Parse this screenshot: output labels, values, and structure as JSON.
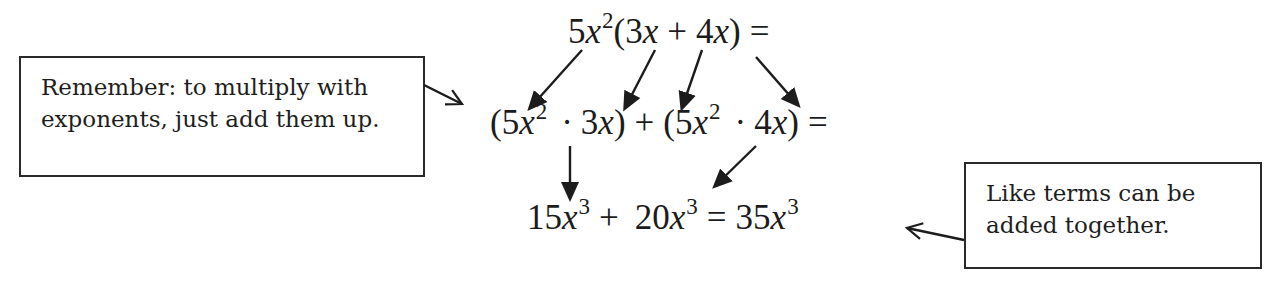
{
  "notes": {
    "left": {
      "lines": [
        "Remember:  to multiply with",
        "exponents, just add them up."
      ]
    },
    "right": {
      "lines": [
        "Like terms can be",
        "added together."
      ]
    }
  },
  "equation": {
    "row1": {
      "coef": "5",
      "var": "x",
      "exp": "2",
      "open": "(",
      "t1_coef": "3",
      "t1_var": "x",
      "plus": "+",
      "t2_coef": "4",
      "t2_var": "x",
      "close": ")",
      "equals": "="
    },
    "row2": {
      "open1": "(",
      "a_coef": "5",
      "a_var": "x",
      "a_exp": "2",
      "dot1": "·",
      "b_coef": "3",
      "b_var": "x",
      "close1": ")",
      "plus": "+",
      "open2": "(",
      "c_coef": "5",
      "c_var": "x",
      "c_exp": "2",
      "dot2": "·",
      "d_coef": "4",
      "d_var": "x",
      "close2": ")",
      "equals": "="
    },
    "row3": {
      "t1_coef": "15",
      "t1_var": "x",
      "t1_exp": "3",
      "plus": "+",
      "t2_coef": "20",
      "t2_var": "x",
      "t2_exp": "3",
      "equals": "=",
      "r_coef": "35",
      "r_var": "x",
      "r_exp": "3"
    }
  },
  "arrows": [
    {
      "name": "arrow-5x2-to-first-group",
      "from": [
        582,
        50
      ],
      "to": [
        530,
        108
      ]
    },
    {
      "name": "arrow-3x-to-first-group",
      "from": [
        655,
        50
      ],
      "to": [
        625,
        108
      ]
    },
    {
      "name": "arrow-plus-to-second-group",
      "from": [
        702,
        50
      ],
      "to": [
        682,
        108
      ]
    },
    {
      "name": "arrow-4x-to-second-group",
      "from": [
        756,
        57
      ],
      "to": [
        798,
        105
      ]
    },
    {
      "name": "arrow-first-product-to-15x3",
      "from": [
        570,
        146
      ],
      "to": [
        570,
        198
      ]
    },
    {
      "name": "arrow-second-product-to-20x3",
      "from": [
        756,
        146
      ],
      "to": [
        715,
        186
      ]
    },
    {
      "name": "arrow-left-note-pointer",
      "from": [
        424,
        85
      ],
      "to": [
        462,
        104
      ]
    },
    {
      "name": "arrow-right-note-pointer",
      "from": [
        964,
        240
      ],
      "to": [
        907,
        228
      ]
    }
  ],
  "colors": {
    "ink": "#1c1c1c",
    "border": "#2a2a2a",
    "background": "#ffffff"
  }
}
